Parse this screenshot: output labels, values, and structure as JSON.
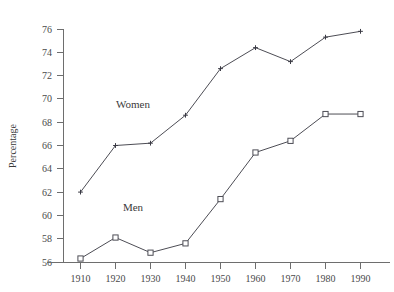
{
  "chart_data": {
    "type": "line",
    "title": "",
    "xlabel": "",
    "ylabel": "Percentage",
    "x": [
      1910,
      1920,
      1930,
      1940,
      1950,
      1960,
      1970,
      1980,
      1990
    ],
    "xtick_labels": [
      "1910",
      "1920",
      "1930",
      "1940",
      "1950",
      "1960",
      "1970",
      "1980",
      "1990"
    ],
    "ytick_labels": [
      "56",
      "58",
      "60",
      "62",
      "64",
      "66",
      "68",
      "70",
      "72",
      "74",
      "76"
    ],
    "yticks": [
      56,
      58,
      60,
      62,
      64,
      66,
      68,
      70,
      72,
      74,
      76
    ],
    "ylim": [
      56,
      76
    ],
    "xlim": [
      1905,
      1995
    ],
    "grid": false,
    "legend": "inline-annotations",
    "series": [
      {
        "name": "Women",
        "marker": "plus",
        "color": "#3a3a44",
        "values": [
          62.0,
          66.0,
          66.2,
          68.6,
          72.6,
          74.4,
          73.2,
          75.3,
          75.8
        ]
      },
      {
        "name": "Men",
        "marker": "open-square",
        "color": "#4d4d55",
        "values": [
          56.3,
          58.1,
          56.8,
          57.6,
          61.4,
          65.4,
          66.4,
          68.7,
          68.7
        ]
      }
    ],
    "annotations": [
      {
        "text": "Women",
        "x": 1925,
        "y": 69.2
      },
      {
        "text": "Men",
        "x": 1925,
        "y": 60.4
      }
    ]
  },
  "axes": {
    "y_axis_title": "Percentage"
  }
}
